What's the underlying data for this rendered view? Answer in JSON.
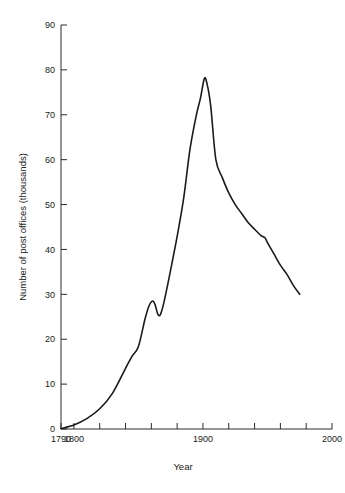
{
  "chart_data": {
    "type": "line",
    "title": "",
    "xlabel": "Year",
    "ylabel": "Number of post offices (thousands)",
    "xlim": [
      1790,
      2000
    ],
    "ylim": [
      0,
      90
    ],
    "grid": false,
    "legend": null,
    "x_ticks": [
      1790,
      1800,
      1820,
      1840,
      1860,
      1880,
      1900,
      1920,
      1940,
      1960,
      1980,
      2000
    ],
    "x_tick_labels": [
      "1790",
      "1800",
      "",
      "",
      "",
      "",
      "1900",
      "",
      "",
      "",
      "",
      "2000"
    ],
    "y_ticks": [
      0,
      10,
      20,
      30,
      40,
      50,
      60,
      70,
      80,
      90
    ],
    "y_tick_labels": [
      "0",
      "10",
      "20",
      "30",
      "40",
      "50",
      "60",
      "70",
      "80",
      "90"
    ],
    "series": [
      {
        "name": "Number of post offices",
        "color": "#1a1a1a",
        "x": [
          1790,
          1800,
          1810,
          1820,
          1830,
          1840,
          1845,
          1850,
          1855,
          1858,
          1861,
          1863,
          1865,
          1867,
          1870,
          1875,
          1880,
          1885,
          1890,
          1895,
          1898,
          1901,
          1903,
          1906,
          1910,
          1915,
          1920,
          1925,
          1930,
          1935,
          1940,
          1945,
          1948,
          1950,
          1955,
          1960,
          1965,
          1970,
          1975
        ],
        "y": [
          0.1,
          0.9,
          2.3,
          4.5,
          8.0,
          13.5,
          16.2,
          18.4,
          24.4,
          27.3,
          28.5,
          27.6,
          25.6,
          25.5,
          28.5,
          35.5,
          42.9,
          51.3,
          62.4,
          70.1,
          73.6,
          78.0,
          77.1,
          72.0,
          60.0,
          56.0,
          52.6,
          50.0,
          48.0,
          46.0,
          44.5,
          43.1,
          42.6,
          41.5,
          39.0,
          36.5,
          34.5,
          32.0,
          30.0
        ],
        "peak": {
          "year": 1901,
          "value": 78.0
        },
        "local_max": {
          "year": 1861,
          "value": 28.5
        },
        "local_min": {
          "year": 1867,
          "value": 25.5
        },
        "end": {
          "year": 1975,
          "value": 30.0
        }
      }
    ]
  }
}
